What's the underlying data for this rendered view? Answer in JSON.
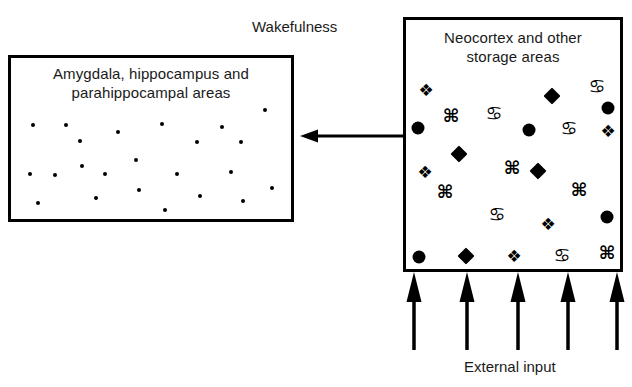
{
  "diagram": {
    "state_label": "Wakefulness",
    "external_input_label": "External input",
    "left_box": {
      "title": "Amygdala, hippocampus and\nparahippocampal areas",
      "marks": [
        {
          "type": "dot",
          "x": 265,
          "y": 110
        },
        {
          "type": "dot",
          "x": 33,
          "y": 125
        },
        {
          "type": "dot",
          "x": 66,
          "y": 125
        },
        {
          "type": "dot",
          "x": 118,
          "y": 132
        },
        {
          "type": "dot",
          "x": 162,
          "y": 124
        },
        {
          "type": "dot",
          "x": 222,
          "y": 127
        },
        {
          "type": "dot",
          "x": 80,
          "y": 141
        },
        {
          "type": "dot",
          "x": 197,
          "y": 142
        },
        {
          "type": "dot",
          "x": 241,
          "y": 142
        },
        {
          "type": "dot",
          "x": 136,
          "y": 160
        },
        {
          "type": "dot",
          "x": 82,
          "y": 166
        },
        {
          "type": "dot",
          "x": 30,
          "y": 174
        },
        {
          "type": "dot",
          "x": 55,
          "y": 175
        },
        {
          "type": "dot",
          "x": 105,
          "y": 174
        },
        {
          "type": "dot",
          "x": 177,
          "y": 174
        },
        {
          "type": "dot",
          "x": 231,
          "y": 172
        },
        {
          "type": "dot",
          "x": 139,
          "y": 190
        },
        {
          "type": "dot",
          "x": 272,
          "y": 188
        },
        {
          "type": "dot",
          "x": 96,
          "y": 198
        },
        {
          "type": "dot",
          "x": 200,
          "y": 196
        },
        {
          "type": "dot",
          "x": 38,
          "y": 203
        },
        {
          "type": "dot",
          "x": 243,
          "y": 201
        },
        {
          "type": "dot",
          "x": 165,
          "y": 210
        }
      ]
    },
    "right_box": {
      "title": "Neocortex and other\nstorage areas",
      "marks": [
        {
          "type": "floret",
          "glyph": "❖",
          "x": 426,
          "y": 90,
          "name": "floret-mark"
        },
        {
          "type": "cancer",
          "glyph": "♋",
          "x": 597,
          "y": 86,
          "name": "cancer-mark"
        },
        {
          "type": "diamond",
          "x": 552,
          "y": 96,
          "name": "diamond-mark"
        },
        {
          "type": "circle",
          "x": 608,
          "y": 108,
          "name": "circle-mark"
        },
        {
          "type": "command",
          "glyph": "⌘",
          "x": 451,
          "y": 116,
          "name": "command-mark"
        },
        {
          "type": "cancer",
          "glyph": "♋",
          "x": 494,
          "y": 113,
          "name": "cancer-mark"
        },
        {
          "type": "circle",
          "x": 418,
          "y": 128,
          "name": "circle-mark"
        },
        {
          "type": "circle",
          "x": 529,
          "y": 130,
          "name": "circle-mark"
        },
        {
          "type": "cancer",
          "glyph": "♋",
          "x": 569,
          "y": 128,
          "name": "cancer-mark"
        },
        {
          "type": "floret",
          "glyph": "❖",
          "x": 608,
          "y": 131,
          "name": "floret-mark"
        },
        {
          "type": "diamond",
          "x": 459,
          "y": 154,
          "name": "diamond-mark"
        },
        {
          "type": "floret",
          "glyph": "❖",
          "x": 425,
          "y": 172,
          "name": "floret-mark"
        },
        {
          "type": "command",
          "glyph": "⌘",
          "x": 512,
          "y": 168,
          "name": "command-mark"
        },
        {
          "type": "diamond",
          "x": 538,
          "y": 171,
          "name": "diamond-mark"
        },
        {
          "type": "command",
          "glyph": "⌘",
          "x": 445,
          "y": 192,
          "name": "command-mark"
        },
        {
          "type": "command",
          "glyph": "⌘",
          "x": 579,
          "y": 190,
          "name": "command-mark"
        },
        {
          "type": "cancer",
          "glyph": "♋",
          "x": 497,
          "y": 214,
          "name": "cancer-mark"
        },
        {
          "type": "floret",
          "glyph": "❖",
          "x": 548,
          "y": 224,
          "name": "floret-mark"
        },
        {
          "type": "circle",
          "x": 607,
          "y": 217,
          "name": "circle-mark"
        },
        {
          "type": "circle",
          "x": 419,
          "y": 257,
          "name": "circle-mark"
        },
        {
          "type": "diamond",
          "x": 466,
          "y": 256,
          "name": "diamond-mark"
        },
        {
          "type": "floret",
          "glyph": "❖",
          "x": 514,
          "y": 256,
          "name": "floret-mark"
        },
        {
          "type": "cancer",
          "glyph": "♋",
          "x": 562,
          "y": 255,
          "name": "cancer-mark"
        },
        {
          "type": "command",
          "glyph": "⌘",
          "x": 607,
          "y": 253,
          "name": "command-mark"
        }
      ]
    },
    "feedback_arrow": {
      "direction": "left",
      "from_x": 403,
      "to_x": 300,
      "y": 136
    },
    "input_arrows": {
      "direction": "up",
      "count": 5,
      "x_positions": [
        414,
        467,
        518,
        568,
        617
      ],
      "top_y": 272,
      "bottom_y": 350
    },
    "colors": {
      "stroke": "#000000",
      "text": "#1a1a1a",
      "background": "#ffffff"
    }
  }
}
